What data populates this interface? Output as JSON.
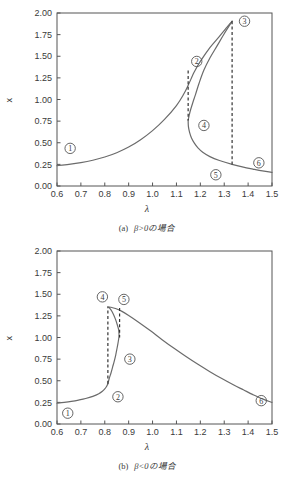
{
  "figure_a": {
    "caption_tag": "(a)",
    "caption_text": "β>0の場合",
    "xlabel": "λ",
    "ylabel": "x"
  },
  "figure_b": {
    "caption_tag": "(b)",
    "caption_text": "β<0の場合",
    "xlabel": "λ",
    "ylabel": "x"
  },
  "chart_data": [
    {
      "type": "line",
      "title": "",
      "subtitle": "(a) β>0の場合",
      "xlabel": "λ",
      "ylabel": "x",
      "xlim": [
        0.6,
        1.5
      ],
      "ylim": [
        0.0,
        2.0
      ],
      "xticks": [
        "0.6",
        "0.7",
        "0.8",
        "0.9",
        "1.0",
        "1.1",
        "1.2",
        "1.3",
        "1.4",
        "1.5"
      ],
      "yticks": [
        "0.00",
        "0.25",
        "0.50",
        "0.75",
        "1.00",
        "1.25",
        "1.50",
        "1.75",
        "2.00"
      ],
      "grid": false,
      "legend": "none",
      "series": [
        {
          "name": "lower-stable-branch-rising",
          "points": [
            [
              0.6,
              0.235
            ],
            [
              0.65,
              0.25
            ],
            [
              0.7,
              0.27
            ],
            [
              0.75,
              0.298
            ],
            [
              0.8,
              0.335
            ],
            [
              0.85,
              0.385
            ],
            [
              0.9,
              0.45
            ],
            [
              0.95,
              0.535
            ],
            [
              1.0,
              0.64
            ],
            [
              1.05,
              0.77
            ],
            [
              1.1,
              0.93
            ],
            [
              1.13,
              1.06
            ],
            [
              1.15,
              1.17
            ],
            [
              1.175,
              1.32
            ],
            [
              1.2,
              1.44
            ],
            [
              1.24,
              1.6
            ],
            [
              1.28,
              1.73
            ],
            [
              1.31,
              1.83
            ],
            [
              1.325,
              1.88
            ],
            [
              1.333,
              1.905
            ]
          ]
        },
        {
          "name": "unstable-middle-branch",
          "points": [
            [
              1.333,
              1.905
            ],
            [
              1.3,
              1.76
            ],
            [
              1.27,
              1.62
            ],
            [
              1.24,
              1.48
            ],
            [
              1.215,
              1.34
            ],
            [
              1.195,
              1.19
            ],
            [
              1.18,
              1.06
            ],
            [
              1.168,
              0.96
            ],
            [
              1.158,
              0.87
            ],
            [
              1.152,
              0.8
            ],
            [
              1.149,
              0.76
            ]
          ]
        },
        {
          "name": "lower-stable-branch-falling",
          "points": [
            [
              1.149,
              0.76
            ],
            [
              1.15,
              0.69
            ],
            [
              1.155,
              0.62
            ],
            [
              1.163,
              0.555
            ],
            [
              1.175,
              0.495
            ],
            [
              1.19,
              0.44
            ],
            [
              1.21,
              0.39
            ],
            [
              1.24,
              0.34
            ],
            [
              1.28,
              0.295
            ],
            [
              1.333,
              0.25
            ],
            [
              1.38,
              0.218
            ],
            [
              1.42,
              0.196
            ],
            [
              1.46,
              0.175
            ],
            [
              1.5,
              0.158
            ]
          ]
        }
      ],
      "annotations": [
        {
          "label": "1",
          "x": 0.655,
          "y": 0.435
        },
        {
          "label": "2",
          "x": 1.185,
          "y": 1.44
        },
        {
          "label": "3",
          "x": 1.385,
          "y": 1.905
        },
        {
          "label": "4",
          "x": 1.215,
          "y": 0.7
        },
        {
          "label": "5",
          "x": 1.265,
          "y": 0.13
        },
        {
          "label": "6",
          "x": 1.445,
          "y": 0.268
        }
      ],
      "dashed_jumps": [
        {
          "name": "jump-down-at-lambda2",
          "x": 1.149,
          "y_from": 1.335,
          "y_to": 0.76
        },
        {
          "name": "jump-up-at-lambda3",
          "x": 1.333,
          "y_from": 1.905,
          "y_to": 0.25
        }
      ]
    },
    {
      "type": "line",
      "title": "",
      "subtitle": "(b) β<0の場合",
      "xlabel": "λ",
      "ylabel": "x",
      "xlim": [
        0.6,
        1.5
      ],
      "ylim": [
        0.0,
        2.0
      ],
      "xticks": [
        "0.6",
        "0.7",
        "0.8",
        "0.9",
        "1.0",
        "1.1",
        "1.2",
        "1.3",
        "1.4",
        "1.5"
      ],
      "yticks": [
        "0.00",
        "0.25",
        "0.50",
        "0.75",
        "1.00",
        "1.25",
        "1.50",
        "1.75",
        "2.00"
      ],
      "grid": false,
      "legend": "none",
      "series": [
        {
          "name": "lower-stable-branch-rising",
          "points": [
            [
              0.6,
              0.24
            ],
            [
              0.63,
              0.25
            ],
            [
              0.66,
              0.262
            ],
            [
              0.69,
              0.277
            ],
            [
              0.72,
              0.295
            ],
            [
              0.75,
              0.32
            ],
            [
              0.775,
              0.35
            ],
            [
              0.79,
              0.378
            ],
            [
              0.8,
              0.405
            ],
            [
              0.808,
              0.437
            ],
            [
              0.813,
              0.465
            ]
          ]
        },
        {
          "name": "unstable-middle-branch",
          "points": [
            [
              0.813,
              0.465
            ],
            [
              0.818,
              0.52
            ],
            [
              0.826,
              0.59
            ],
            [
              0.833,
              0.66
            ],
            [
              0.84,
              0.73
            ],
            [
              0.846,
              0.8
            ],
            [
              0.851,
              0.87
            ],
            [
              0.855,
              0.93
            ],
            [
              0.858,
              0.98
            ],
            [
              0.86,
              1.02
            ]
          ]
        },
        {
          "name": "upper-stable-branch",
          "points": [
            [
              0.86,
              1.02
            ],
            [
              0.858,
              1.09
            ],
            [
              0.852,
              1.15
            ],
            [
              0.845,
              1.21
            ],
            [
              0.836,
              1.27
            ],
            [
              0.826,
              1.32
            ],
            [
              0.817,
              1.348
            ],
            [
              0.812,
              1.355
            ],
            [
              0.825,
              1.35
            ],
            [
              0.845,
              1.335
            ],
            [
              0.87,
              1.305
            ],
            [
              0.9,
              1.255
            ],
            [
              0.94,
              1.18
            ],
            [
              0.99,
              1.08
            ],
            [
              1.04,
              0.975
            ],
            [
              1.09,
              0.875
            ],
            [
              1.14,
              0.78
            ],
            [
              1.19,
              0.69
            ],
            [
              1.24,
              0.605
            ],
            [
              1.29,
              0.525
            ],
            [
              1.34,
              0.45
            ],
            [
              1.38,
              0.395
            ],
            [
              1.42,
              0.34
            ],
            [
              1.46,
              0.29
            ],
            [
              1.5,
              0.25
            ]
          ]
        }
      ],
      "annotations": [
        {
          "label": "1",
          "x": 0.645,
          "y": 0.125
        },
        {
          "label": "2",
          "x": 0.855,
          "y": 0.315
        },
        {
          "label": "3",
          "x": 0.905,
          "y": 0.75
        },
        {
          "label": "4",
          "x": 0.79,
          "y": 1.47
        },
        {
          "label": "5",
          "x": 0.88,
          "y": 1.44
        },
        {
          "label": "6",
          "x": 1.455,
          "y": 0.27
        }
      ],
      "dashed_jumps": [
        {
          "name": "jump-up-at-lambda4",
          "x": 0.813,
          "y_from": 0.465,
          "y_to": 1.35
        },
        {
          "name": "jump-down-at-lambda5",
          "x": 0.862,
          "y_from": 1.34,
          "y_to": 1.0
        }
      ]
    }
  ]
}
